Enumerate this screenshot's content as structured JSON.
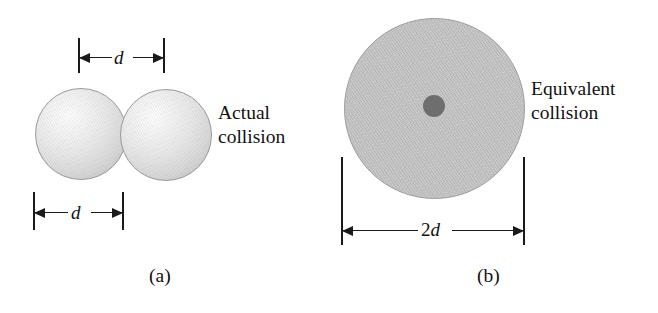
{
  "figure": {
    "background_color": "#ffffff",
    "width": 658,
    "height": 313
  },
  "panel_a": {
    "caption": "(a)",
    "annotation_line1": "Actual",
    "annotation_line2": "collision",
    "top_dimension": {
      "label": "d",
      "meaning": "center-to-center separation of the two colliding spheres"
    },
    "bottom_dimension": {
      "label": "d",
      "meaning": "diameter of a single sphere"
    },
    "spheres": [
      {
        "name": "left-sphere",
        "fill": "#e2e2e2",
        "edge": "#9a9a9a"
      },
      {
        "name": "right-sphere",
        "fill": "#e8e8e8",
        "edge": "#9a9a9a"
      }
    ]
  },
  "panel_b": {
    "caption": "(b)",
    "annotation_line1": "Equivalent",
    "annotation_line2": "collision",
    "bottom_dimension": {
      "label_coefficient": "2",
      "label_symbol": "d",
      "meaning": "diameter of the equivalent collision disc"
    },
    "disc": {
      "name": "equivalent-disc",
      "fill": "#c0c0c0",
      "edge": "#9d9d9d"
    },
    "center_dot": {
      "name": "point-particle",
      "fill": "#6e6e6e"
    }
  },
  "colors": {
    "ink": "#1a1a1a",
    "sphere_light": "#fbfbfb",
    "sphere_mid": "#d6d6d6",
    "sphere_dark": "#b4b4b4",
    "disc_gray": "#c0c0c0",
    "dot_gray": "#6e6e6e"
  }
}
